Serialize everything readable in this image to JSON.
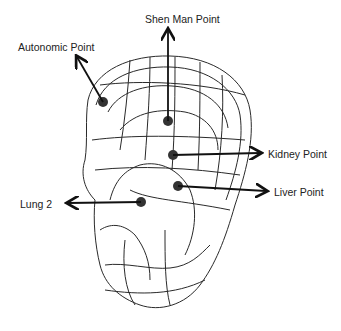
{
  "diagram": {
    "colors": {
      "line": "#2a2a2a",
      "point": "#333333",
      "arrow": "#111111",
      "background": "#ffffff"
    },
    "labels": [
      {
        "id": "shen-man",
        "text": "Shen Man Point"
      },
      {
        "id": "autonomic",
        "text": "Autonomic Point"
      },
      {
        "id": "kidney",
        "text": "Kidney Point"
      },
      {
        "id": "liver",
        "text": "Liver Point"
      },
      {
        "id": "lung2",
        "text": "Lung 2"
      }
    ]
  }
}
